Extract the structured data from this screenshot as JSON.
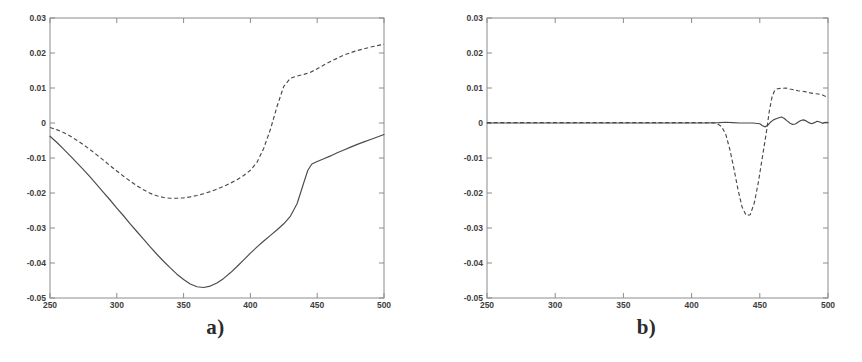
{
  "figure": {
    "background": "#ffffff",
    "line_color": "#4a4a4a",
    "axis_color": "#8c8c8c",
    "panel_count": 2
  },
  "panels": [
    {
      "id": "a",
      "caption": "a)"
    },
    {
      "id": "b",
      "caption": "b)"
    }
  ],
  "chart_data": [
    {
      "type": "line",
      "panel": "a",
      "title": "a)",
      "xlabel": "",
      "ylabel": "",
      "xlim": [
        250,
        500
      ],
      "ylim": [
        -0.05,
        0.03
      ],
      "xticks": [
        250,
        300,
        350,
        400,
        450,
        500
      ],
      "yticks": [
        -0.05,
        -0.04,
        -0.03,
        -0.02,
        -0.01,
        0,
        0.01,
        0.02,
        0.03
      ],
      "xtick_labels": [
        "250",
        "300",
        "350",
        "400",
        "450",
        "500"
      ],
      "ytick_labels": [
        "-0.05",
        "-0.04",
        "-0.03",
        "-0.02",
        "-0.01",
        "0",
        "0.01",
        "0.02",
        "0.03"
      ],
      "grid": false,
      "legend": null,
      "series": [
        {
          "name": "solid-curve",
          "style": "solid",
          "x": [
            250,
            255,
            260,
            265,
            270,
            275,
            280,
            285,
            290,
            295,
            300,
            305,
            310,
            315,
            320,
            325,
            330,
            335,
            340,
            345,
            350,
            355,
            360,
            365,
            370,
            375,
            380,
            385,
            390,
            395,
            400,
            405,
            410,
            415,
            420,
            425,
            430,
            435,
            440,
            443,
            446,
            450,
            455,
            460,
            465,
            470,
            475,
            480,
            485,
            490,
            495,
            500
          ],
          "values": [
            -0.0038,
            -0.0055,
            -0.0074,
            -0.0093,
            -0.0113,
            -0.0133,
            -0.0154,
            -0.0176,
            -0.0198,
            -0.022,
            -0.0243,
            -0.0265,
            -0.0288,
            -0.031,
            -0.0332,
            -0.0354,
            -0.0375,
            -0.0395,
            -0.0414,
            -0.0432,
            -0.0447,
            -0.046,
            -0.0468,
            -0.047,
            -0.0466,
            -0.0457,
            -0.0444,
            -0.0428,
            -0.041,
            -0.0391,
            -0.0372,
            -0.0354,
            -0.0337,
            -0.0321,
            -0.0305,
            -0.0288,
            -0.0266,
            -0.023,
            -0.017,
            -0.0135,
            -0.0117,
            -0.011,
            -0.0102,
            -0.0094,
            -0.0085,
            -0.0077,
            -0.0069,
            -0.0061,
            -0.0054,
            -0.0047,
            -0.004,
            -0.0033
          ]
        },
        {
          "name": "dashed-curve",
          "style": "dashed",
          "x": [
            250,
            255,
            260,
            265,
            270,
            275,
            280,
            285,
            290,
            295,
            300,
            305,
            310,
            315,
            320,
            325,
            330,
            335,
            340,
            345,
            350,
            355,
            360,
            365,
            370,
            375,
            380,
            385,
            390,
            395,
            400,
            405,
            410,
            415,
            420,
            425,
            430,
            435,
            440,
            445,
            450,
            455,
            460,
            465,
            470,
            475,
            480,
            485,
            490,
            495,
            500
          ],
          "values": [
            -0.0013,
            -0.0019,
            -0.0027,
            -0.0037,
            -0.0049,
            -0.0062,
            -0.0076,
            -0.0091,
            -0.0106,
            -0.0122,
            -0.0137,
            -0.0152,
            -0.0166,
            -0.0179,
            -0.0191,
            -0.0201,
            -0.0208,
            -0.0213,
            -0.0215,
            -0.0215,
            -0.0214,
            -0.0211,
            -0.0207,
            -0.0202,
            -0.0196,
            -0.0189,
            -0.0181,
            -0.0172,
            -0.0162,
            -0.015,
            -0.0135,
            -0.0112,
            -0.0072,
            -0.0018,
            0.0048,
            0.0105,
            0.0128,
            0.0134,
            0.0139,
            0.0145,
            0.0155,
            0.0166,
            0.0176,
            0.0185,
            0.0194,
            0.0201,
            0.0207,
            0.0212,
            0.0217,
            0.0221,
            0.0225
          ]
        }
      ]
    },
    {
      "type": "line",
      "panel": "b",
      "title": "b)",
      "xlabel": "",
      "ylabel": "",
      "xlim": [
        250,
        500
      ],
      "ylim": [
        -0.05,
        0.03
      ],
      "xticks": [
        250,
        300,
        350,
        400,
        450,
        500
      ],
      "yticks": [
        -0.05,
        -0.04,
        -0.03,
        -0.02,
        -0.01,
        0,
        0.01,
        0.02,
        0.03
      ],
      "xtick_labels": [
        "250",
        "300",
        "350",
        "400",
        "450",
        "500"
      ],
      "ytick_labels": [
        "-0.05",
        "-0.04",
        "-0.03",
        "-0.02",
        "-0.01",
        "0",
        "0.01",
        "0.02",
        "0.03"
      ],
      "grid": false,
      "legend": null,
      "series": [
        {
          "name": "solid-curve",
          "style": "solid",
          "x": [
            250,
            270,
            290,
            310,
            330,
            350,
            370,
            390,
            400,
            410,
            420,
            425,
            430,
            435,
            440,
            445,
            450,
            452,
            454,
            456,
            458,
            460,
            462,
            464,
            466,
            468,
            470,
            472,
            474,
            476,
            478,
            480,
            482,
            484,
            486,
            488,
            490,
            492,
            494,
            496,
            498,
            500
          ],
          "values": [
            0.0,
            0.0,
            0.0,
            0.0,
            0.0,
            0.0,
            0.0,
            0.0,
            0.0,
            0.0,
            0.0001,
            0.0002,
            0.0001,
            0.0,
            0.0,
            0.0,
            -0.0002,
            -0.0008,
            -0.0011,
            -0.0006,
            0.0003,
            0.0009,
            0.0012,
            0.0015,
            0.0017,
            0.0013,
            0.0006,
            0.0,
            -0.0004,
            -0.0003,
            0.0002,
            0.0007,
            0.0009,
            0.0006,
            0.0001,
            -0.0002,
            0.0001,
            0.0005,
            0.0003,
            -0.0001,
            0.0002,
            0.0001
          ]
        },
        {
          "name": "dashed-curve",
          "style": "dashed",
          "x": [
            250,
            270,
            290,
            310,
            330,
            350,
            370,
            390,
            400,
            410,
            418,
            422,
            425,
            428,
            431,
            434,
            437,
            440,
            443,
            446,
            449,
            452,
            455,
            457,
            459,
            461,
            463,
            466,
            469,
            472,
            475,
            478,
            481,
            484,
            487,
            490,
            493,
            496,
            500
          ],
          "values": [
            0.0001,
            0.0001,
            0.0001,
            0.0001,
            0.0001,
            0.0001,
            0.0001,
            0.0001,
            0.0001,
            0.0001,
            0.0,
            -0.001,
            -0.0032,
            -0.0075,
            -0.013,
            -0.019,
            -0.024,
            -0.0264,
            -0.0262,
            -0.0228,
            -0.0168,
            -0.0095,
            -0.0022,
            0.0035,
            0.0075,
            0.0094,
            0.0098,
            0.0099,
            0.01,
            0.0097,
            0.0095,
            0.0092,
            0.0091,
            0.0089,
            0.0086,
            0.0084,
            0.0083,
            0.008,
            0.0073
          ]
        }
      ]
    }
  ]
}
